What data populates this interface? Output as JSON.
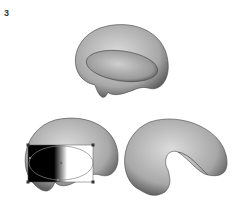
{
  "step": {
    "number": "3"
  },
  "figures": [
    {
      "id": "shape-top",
      "description": "3D shaded kidney shape with inner ellipse"
    },
    {
      "id": "shape-bottom-left",
      "description": "shape with gradient mesh bounding box and handles selected"
    },
    {
      "id": "shape-bottom-right",
      "description": "final 3D shaded kidney shape"
    }
  ],
  "colors": {
    "shape_mid": "#b0b0b0",
    "shape_light": "#d8d8d8",
    "shape_dark": "#555555",
    "handle": "#333333",
    "gradient_dark": "#000000",
    "gradient_light": "#ffffff"
  }
}
